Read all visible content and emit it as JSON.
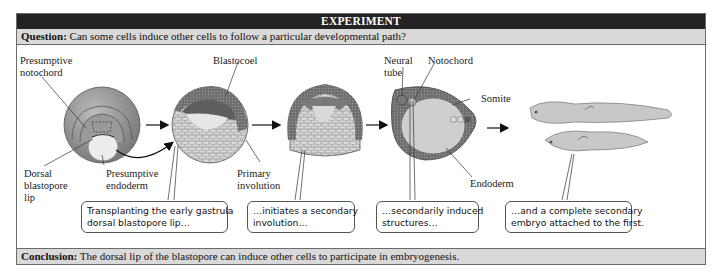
{
  "header": {
    "title": "EXPERIMENT"
  },
  "question": {
    "label": "Question:",
    "text": " Can some cells induce other cells to follow a particular developmental path?"
  },
  "conclusion": {
    "label": "Conclusion:",
    "text": " The dorsal lip of the blastopore can induce other cells to participate in embryogenesis."
  },
  "labels": {
    "presumptive_notochord": "Presumptive\nnotochord",
    "blastocoel": "Blastocoel",
    "dorsal_blastopore_lip": "Dorsal\nblastopore\nlip",
    "presumptive_endoderm": "Presumptive\nendoderm",
    "primary_involution": "Primary\ninvolution",
    "neural_tube": "Neural\ntube",
    "notochord": "Notochord",
    "somite": "Somite",
    "endoderm": "Endoderm"
  },
  "callouts": [
    {
      "text": "Transplanting the early gastrula\ndorsal blastopore lip…"
    },
    {
      "text": "…initiates a secondary\ninvolution…"
    },
    {
      "text": "…secondarily induced\nstructures…"
    },
    {
      "text": "…and a complete secondary\nembryo attached to the first."
    }
  ],
  "colors": {
    "header_bg": "#232323",
    "bar_bg": "#d9d9d9",
    "border": "#6b6b6b"
  }
}
